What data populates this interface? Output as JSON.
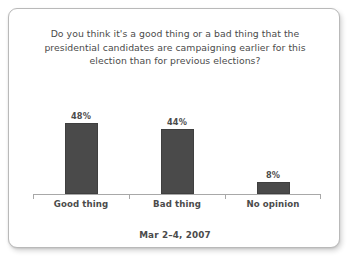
{
  "card": {
    "background_color": "#ffffff",
    "border_color": "#b9b9b9"
  },
  "chart_data": {
    "type": "bar",
    "title": "Do you think it's a good thing or a bad thing that the presidential candidates are campaigning earlier for this election than for previous elections?",
    "title_lines": [
      "Do you think it's a good thing or a bad thing that the",
      "presidential candidates are campaigning earlier for this",
      "election than for previous elections?"
    ],
    "categories": [
      "Good thing",
      "Bad thing",
      "No opinion"
    ],
    "values": [
      48,
      44,
      8
    ],
    "value_labels": [
      "48%",
      "44%",
      "8%"
    ],
    "xlabel": "",
    "ylabel": "",
    "ylim": [
      0,
      100
    ],
    "grid": false,
    "legend": "none",
    "bar_color": "#4a4a4a",
    "axis_color": "#a8a8a8",
    "text_color": "#4b4b4b",
    "footnote": "Mar 2–4, 2007"
  }
}
